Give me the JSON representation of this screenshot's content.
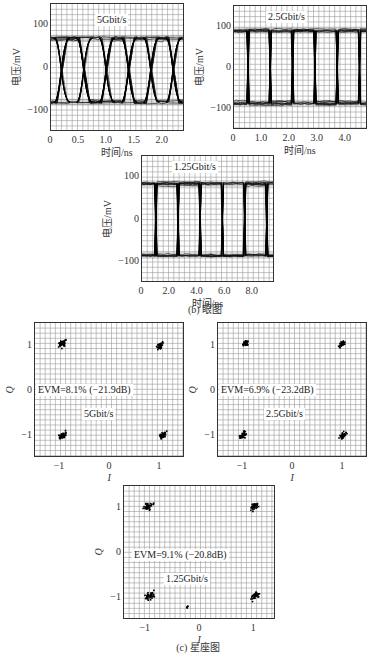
{
  "captions": {
    "eye": "(b) 眼图",
    "constellation": "(c) 星座图"
  },
  "chart_data": [
    {
      "id": "eye-5g",
      "type": "line",
      "title": "5Gbit/s",
      "xlabel": "时间/ns",
      "ylabel": "电压/mV",
      "xlim": [
        0,
        2.4
      ],
      "ylim": [
        -150,
        150
      ],
      "xticks": [
        "0",
        "0.5",
        "1.0",
        "1.5",
        "2.0"
      ],
      "xtick_values": [
        0,
        0.5,
        1.0,
        1.5,
        2.0
      ],
      "yticks": [
        "100",
        "0",
        "−100"
      ],
      "ytick_values": [
        100,
        0,
        -100
      ],
      "grid": true,
      "levels_mV": {
        "high": 70,
        "low": -80
      },
      "bit_period_ns": 0.2,
      "eye_crossings_ns": [
        0.2,
        0.6,
        1.0,
        1.4,
        1.8,
        2.2
      ]
    },
    {
      "id": "eye-2_5g",
      "type": "line",
      "title": "2.5Gbit/s",
      "xlabel": "时间/ns",
      "ylabel": "电压/mV",
      "xlim": [
        0,
        4.8
      ],
      "ylim": [
        -150,
        150
      ],
      "xticks": [
        "0",
        "1.0",
        "2.0",
        "3.0",
        "4.0"
      ],
      "xtick_values": [
        0,
        1.0,
        2.0,
        3.0,
        4.0
      ],
      "yticks": [
        "100",
        "0",
        "−100"
      ],
      "ytick_values": [
        100,
        0,
        -100
      ],
      "grid": true,
      "levels_mV": {
        "high": 90,
        "low": -85
      },
      "bit_period_ns": 0.4,
      "eye_crossings_ns": [
        0.5,
        1.3,
        2.1,
        2.9,
        3.7,
        4.5
      ]
    },
    {
      "id": "eye-1_25g",
      "type": "line",
      "title": "1.25Gbit/s",
      "xlabel": "时间/ns",
      "ylabel": "电压/mV",
      "xlim": [
        0,
        9.6
      ],
      "ylim": [
        -150,
        150
      ],
      "xticks": [
        "0",
        "2.0",
        "4.0",
        "6.0",
        "8.0"
      ],
      "xtick_values": [
        0,
        2.0,
        4.0,
        6.0,
        8.0
      ],
      "yticks": [
        "100",
        "0",
        "−100"
      ],
      "ytick_values": [
        100,
        0,
        -100
      ],
      "grid": true,
      "levels_mV": {
        "high": 85,
        "low": -85
      },
      "bit_period_ns": 0.8,
      "eye_crossings_ns": [
        1.0,
        2.6,
        4.2,
        5.8,
        7.4,
        9.0
      ]
    },
    {
      "id": "const-5g",
      "type": "scatter",
      "title": "5Gbit/s",
      "annotation": "EVM=8.1% (−21.9dB)",
      "xlabel": "I",
      "ylabel": "Q",
      "xlim": [
        -1.5,
        1.5
      ],
      "ylim": [
        -1.5,
        1.5
      ],
      "xticks": [
        "−1",
        "0",
        "1"
      ],
      "xtick_values": [
        -1,
        0,
        1
      ],
      "yticks": [
        "1",
        "0",
        "−1"
      ],
      "ytick_values": [
        1,
        0,
        -1
      ],
      "grid": true,
      "clusters": [
        {
          "I": -0.95,
          "Q": 1.05,
          "spread": 0.12
        },
        {
          "I": 1.0,
          "Q": 1.0,
          "spread": 0.1
        },
        {
          "I": -0.95,
          "Q": -1.0,
          "spread": 0.1
        },
        {
          "I": 1.05,
          "Q": -1.0,
          "spread": 0.1
        }
      ]
    },
    {
      "id": "const-2_5g",
      "type": "scatter",
      "title": "2.5Gbit/s",
      "annotation": "EVM=6.9% (−23.2dB)",
      "xlabel": "I",
      "ylabel": "Q",
      "xlim": [
        -1.5,
        1.5
      ],
      "ylim": [
        -1.5,
        1.5
      ],
      "xticks": [
        "−1",
        "0",
        "1"
      ],
      "xtick_values": [
        -1,
        0,
        1
      ],
      "yticks": [
        "1",
        "0",
        "−1"
      ],
      "ytick_values": [
        1,
        0,
        -1
      ],
      "grid": true,
      "clusters": [
        {
          "I": -0.95,
          "Q": 1.05,
          "spread": 0.08
        },
        {
          "I": 0.98,
          "Q": 1.03,
          "spread": 0.08
        },
        {
          "I": -1.0,
          "Q": -1.0,
          "spread": 0.1
        },
        {
          "I": 1.0,
          "Q": -1.0,
          "spread": 0.1
        }
      ]
    },
    {
      "id": "const-1_25g",
      "type": "scatter",
      "title": "1.25Gbit/s",
      "annotation": "EVM=9.1% (−20.8dB)",
      "xlabel": "I",
      "ylabel": "Q",
      "xlim": [
        -1.4,
        1.4
      ],
      "ylim": [
        -1.5,
        1.5
      ],
      "xticks": [
        "−1",
        "0",
        "1"
      ],
      "xtick_values": [
        -1,
        0,
        1
      ],
      "yticks": [
        "1",
        "0",
        "−1"
      ],
      "ytick_values": [
        1,
        0,
        -1
      ],
      "grid": true,
      "clusters": [
        {
          "I": -0.95,
          "Q": 1.05,
          "spread": 0.12
        },
        {
          "I": 1.0,
          "Q": 1.05,
          "spread": 0.12
        },
        {
          "I": -0.92,
          "Q": -0.95,
          "spread": 0.12
        },
        {
          "I": 1.02,
          "Q": -0.95,
          "spread": 0.12
        },
        {
          "I": -0.22,
          "Q": -1.2,
          "spread": 0.03
        }
      ]
    }
  ]
}
